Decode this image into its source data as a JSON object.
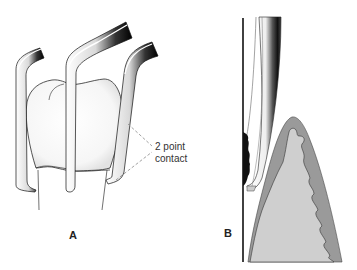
{
  "figure": {
    "panels": [
      {
        "id": "A",
        "label": "A",
        "description": "Three periodontal instruments positioned around a tooth crown",
        "annotation": {
          "line1": "2 point",
          "line2": "contact"
        }
      },
      {
        "id": "B",
        "label": "B",
        "description": "Cross section of instrument tip against tooth surface with calculus and gingival tissue"
      }
    ],
    "colors": {
      "background": "#ffffff",
      "outline": "#222222",
      "instrument_dark": "#111111",
      "instrument_light": "#f2f2f2",
      "tooth_fill": "#fafafa",
      "gingiva_outer": "#9a9a9a",
      "gingiva_inner": "#cfcfcf",
      "calculus": "#111111",
      "dash_line": "#8a8a8a"
    }
  }
}
